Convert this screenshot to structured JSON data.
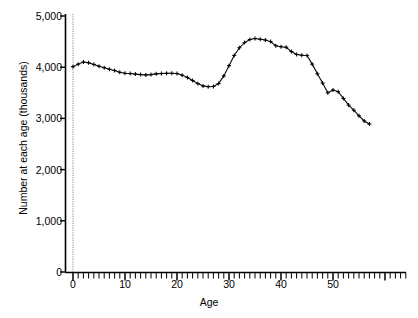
{
  "chart_data": {
    "type": "line",
    "title": "",
    "xlabel": "Age",
    "ylabel": "Number at each age (thousands)",
    "xlim": [
      -1,
      58
    ],
    "ylim": [
      0,
      5000
    ],
    "grid": false,
    "legend": "none",
    "marker": "plus",
    "line_color": "#000000",
    "x_ticks_major": [
      0,
      10,
      20,
      30,
      40,
      50
    ],
    "x_tick_labels": [
      "0",
      "10",
      "20",
      "30",
      "40",
      "50"
    ],
    "x_minor_tick_interval": 1,
    "y_ticks": [
      0,
      1000,
      2000,
      3000,
      4000,
      5000
    ],
    "y_tick_labels": [
      "0",
      "1,000",
      "2,000",
      "3,000",
      "4,000",
      "5,000"
    ],
    "x": [
      0,
      1,
      2,
      3,
      4,
      5,
      6,
      7,
      8,
      9,
      10,
      11,
      12,
      13,
      14,
      15,
      16,
      17,
      18,
      19,
      20,
      21,
      22,
      23,
      24,
      25,
      26,
      27,
      28,
      29,
      30,
      31,
      32,
      33,
      34,
      35,
      36,
      37,
      38,
      39,
      40,
      41,
      42,
      43,
      44,
      45,
      46,
      47,
      48,
      49,
      50,
      51,
      52,
      53,
      54,
      55,
      56,
      57
    ],
    "values": [
      4010,
      4060,
      4100,
      4085,
      4055,
      4020,
      3990,
      3960,
      3935,
      3900,
      3880,
      3875,
      3865,
      3855,
      3850,
      3855,
      3870,
      3875,
      3880,
      3880,
      3875,
      3845,
      3800,
      3740,
      3680,
      3635,
      3620,
      3625,
      3680,
      3830,
      4030,
      4230,
      4380,
      4480,
      4540,
      4560,
      4545,
      4530,
      4500,
      4420,
      4400,
      4390,
      4305,
      4250,
      4235,
      4230,
      4060,
      3870,
      3690,
      3500,
      3555,
      3520,
      3390,
      3260,
      3160,
      3050,
      2950,
      2890
    ],
    "series_name": "Population by single year of age",
    "annotation": ""
  }
}
